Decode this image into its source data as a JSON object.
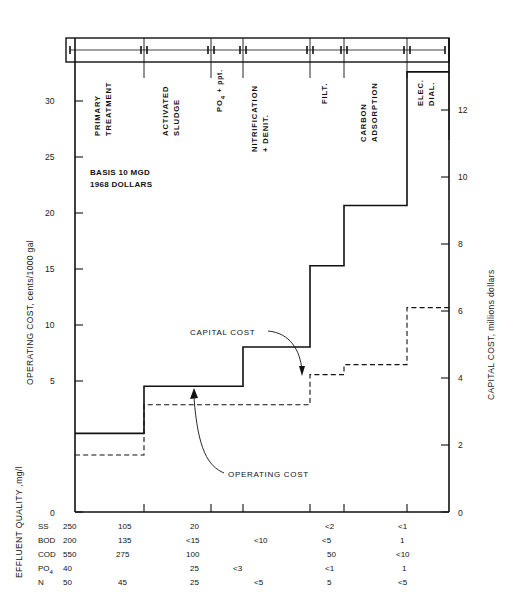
{
  "chart_data": {
    "type": "line",
    "title": "",
    "subtitle": "",
    "notes": [
      "BASIS 10 MGD",
      "1968 DOLLARS"
    ],
    "xlabel": "",
    "categories": [
      "PRIMARY TREATMENT",
      "ACTIVATED SLUDGE",
      "PO4 + ppt.",
      "NITRIFICATION + DENIT.",
      "FILT.",
      "CARBON ADSORPTION",
      "ELEC. DIAL."
    ],
    "stage_labels": [
      {
        "line1": "PRIMARY",
        "line2": "TREATMENT",
        "sub": ""
      },
      {
        "line1": "ACTIVATED",
        "line2": "SLUDGE",
        "sub": ""
      },
      {
        "line1": "PO",
        "line2": "4",
        "sub": " + ppt."
      },
      {
        "line1": "NITRIFICATION",
        "line2": "+ DENIT.",
        "sub": ""
      },
      {
        "line1": "FILT.",
        "line2": "",
        "sub": ""
      },
      {
        "line1": "CARBON",
        "line2": "ADSORPTION",
        "sub": ""
      },
      {
        "line1": "ELEC.",
        "line2": "DIAL.",
        "sub": ""
      }
    ],
    "left_axis": {
      "label": "OPERATING COST, cents/1000 gal",
      "ticks": [
        0,
        5,
        10,
        15,
        20,
        25,
        30
      ],
      "tick_labels": [
        "0",
        "5",
        "10",
        "15",
        "20",
        "25",
        "30"
      ],
      "ylim": [
        0,
        32
      ]
    },
    "right_axis": {
      "label": "CAPITAL COST, millions dollars",
      "ticks": [
        0,
        2,
        4,
        6,
        8,
        10,
        12
      ],
      "tick_labels": [
        "0",
        "2",
        "4",
        "6",
        "8",
        "10",
        "12"
      ],
      "ylim": [
        0,
        12.8
      ]
    },
    "series": [
      {
        "name": "OPERATING COST",
        "style": "solid",
        "axis": "left",
        "units": "cents/1000 gal",
        "step_values": [
          3.0,
          4.8,
          4.8,
          6.3,
          9.4,
          11.7,
          16.8,
          25.9
        ]
      },
      {
        "name": "CAPITAL COST",
        "style": "dashed",
        "axis": "right",
        "units": "millions dollars",
        "step_values": [
          1.7,
          3.2,
          3.2,
          3.2,
          4.1,
          4.4,
          6.1,
          8.4
        ]
      }
    ],
    "annotations": [
      {
        "text": "CAPITAL COST",
        "target": "capital-cost-curve"
      },
      {
        "text": "OPERATING COST",
        "target": "operating-cost-curve"
      }
    ],
    "legend_position": "inline-callout",
    "grid": false
  },
  "table": {
    "side_label": "EFFLUENT QUALITY ,mg/l",
    "row_headers": [
      "SS",
      "BOD",
      "COD",
      "PO₄",
      "N"
    ],
    "rows": [
      {
        "param": "SS",
        "values": [
          "250",
          "105",
          "20",
          "",
          "<2",
          "<1"
        ]
      },
      {
        "param": "BOD",
        "values": [
          "200",
          "135",
          "<15",
          "<10",
          "<5",
          "1"
        ]
      },
      {
        "param": "COD",
        "values": [
          "550",
          "275",
          "100",
          "",
          "50",
          "<10"
        ]
      },
      {
        "param": "PO4",
        "values": [
          "40",
          "",
          "25",
          "<3",
          "<1",
          "1"
        ]
      },
      {
        "param": "N",
        "values": [
          "50",
          "45",
          "25",
          "<5",
          "5",
          "<5"
        ]
      }
    ]
  }
}
